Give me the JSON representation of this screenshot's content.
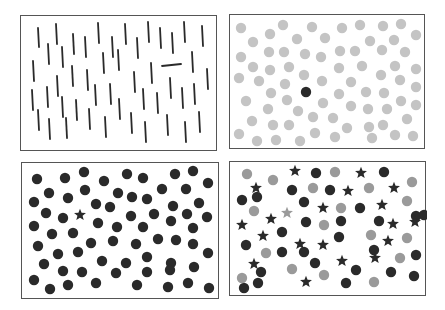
{
  "figure": {
    "title": "Visual search display examples",
    "colors": {
      "background": "#ffffff",
      "border": "#555555",
      "dark": "#2a2a2a",
      "light_gray": "#c4c4c4",
      "mid_gray": "#9a9a9a"
    },
    "panels": [
      {
        "id": "orientation",
        "label": "Orientation pop-out",
        "rect": [
          20,
          15,
          197,
          136
        ],
        "distractor": "vertical-bar",
        "target": "horizontal-bar",
        "items": {
          "vertical_bars": [
            [
              37,
              27,
              46
            ],
            [
              55,
              23,
              43
            ],
            [
              72,
              33,
              53
            ],
            [
              84,
              36,
              56
            ],
            [
              97,
              22,
              42
            ],
            [
              124,
              23,
              43
            ],
            [
              147,
              21,
              41
            ],
            [
              159,
              27,
              47
            ],
            [
              183,
              21,
              41
            ],
            [
              201,
              25,
              45
            ],
            [
              47,
              43,
              63
            ],
            [
              61,
              46,
              66
            ],
            [
              111,
              36,
              56
            ],
            [
              136,
              37,
              57
            ],
            [
              171,
              32,
              52
            ],
            [
              102,
              52,
              72
            ],
            [
              117,
              49,
              69
            ],
            [
              191,
              51,
              71
            ],
            [
              32,
              60,
              80
            ],
            [
              71,
              65,
              85
            ],
            [
              56,
              75,
              95
            ],
            [
              86,
              69,
              89
            ],
            [
              150,
              62,
              82
            ],
            [
              206,
              68,
              88
            ],
            [
              133,
              71,
              91
            ],
            [
              31,
              89,
              109
            ],
            [
              46,
              86,
              106
            ],
            [
              61,
              96,
              116
            ],
            [
              94,
              84,
              104
            ],
            [
              109,
              83,
              103
            ],
            [
              169,
              77,
              97
            ],
            [
              181,
              87,
              107
            ],
            [
              193,
              83,
              103
            ],
            [
              75,
              99,
              119
            ],
            [
              118,
              98,
              118
            ],
            [
              142,
              88,
              108
            ],
            [
              156,
              92,
              112
            ],
            [
              37,
              109,
              129
            ],
            [
              48,
              118,
              138
            ],
            [
              65,
              117,
              137
            ],
            [
              88,
              108,
              128
            ],
            [
              104,
              116,
              136
            ],
            [
              130,
              112,
              132
            ],
            [
              144,
              121,
              141
            ],
            [
              166,
              114,
              134
            ],
            [
              184,
              121,
              141
            ],
            [
              198,
              111,
              131
            ]
          ],
          "horizontal_bars": [
            [
              161,
              180,
              64
            ]
          ]
        }
      },
      {
        "id": "color",
        "label": "Color pop-out",
        "rect": [
          229,
          14,
          196,
          135
        ],
        "distractor": "light-gray-circle",
        "target": "black-circle",
        "items": {
          "gray_circles": [
            [
              240,
              27
            ],
            [
              282,
              24
            ],
            [
              311,
              26
            ],
            [
              341,
              27
            ],
            [
              359,
              24
            ],
            [
              382,
              25
            ],
            [
              400,
              23
            ],
            [
              415,
              34
            ],
            [
              252,
              41
            ],
            [
              269,
              33
            ],
            [
              296,
              38
            ],
            [
              324,
              37
            ],
            [
              369,
              40
            ],
            [
              393,
              39
            ],
            [
              240,
              56
            ],
            [
              268,
              51
            ],
            [
              283,
              51
            ],
            [
              304,
              53
            ],
            [
              320,
              56
            ],
            [
              339,
              50
            ],
            [
              354,
              50
            ],
            [
              381,
              49
            ],
            [
              404,
              51
            ],
            [
              252,
              66
            ],
            [
              269,
              69
            ],
            [
              288,
              66
            ],
            [
              338,
              67
            ],
            [
              361,
              65
            ],
            [
              380,
              74
            ],
            [
              394,
              65
            ],
            [
              415,
              68
            ],
            [
              238,
              77
            ],
            [
              258,
              80
            ],
            [
              284,
              83
            ],
            [
              303,
              74
            ],
            [
              321,
              80
            ],
            [
              350,
              81
            ],
            [
              399,
              79
            ],
            [
              415,
              86
            ],
            [
              270,
              92
            ],
            [
              286,
              99
            ],
            [
              338,
              93
            ],
            [
              365,
              91
            ],
            [
              383,
              92
            ],
            [
              245,
              100
            ],
            [
              267,
              108
            ],
            [
              297,
              110
            ],
            [
              322,
              102
            ],
            [
              350,
              105
            ],
            [
              367,
              108
            ],
            [
              386,
              108
            ],
            [
              400,
              100
            ],
            [
              415,
              104
            ],
            [
              251,
              120
            ],
            [
              272,
              124
            ],
            [
              288,
              124
            ],
            [
              312,
              116
            ],
            [
              332,
              117
            ],
            [
              346,
              127
            ],
            [
              368,
              126
            ],
            [
              382,
              124
            ],
            [
              406,
              118
            ],
            [
              238,
              133
            ],
            [
              256,
              140
            ],
            [
              275,
              139
            ],
            [
              299,
              140
            ],
            [
              314,
              132
            ],
            [
              334,
              136
            ],
            [
              371,
              137
            ],
            [
              394,
              134
            ],
            [
              412,
              135
            ]
          ],
          "black_circles": [
            [
              305,
              91
            ]
          ]
        }
      },
      {
        "id": "shape",
        "label": "Shape pop-out",
        "rect": [
          21,
          162,
          198,
          137
        ],
        "distractor": "black-circle",
        "target": "black-star",
        "items": {
          "black_circles": [
            [
              36,
              178
            ],
            [
              64,
              177
            ],
            [
              83,
              171
            ],
            [
              103,
              180
            ],
            [
              126,
              173
            ],
            [
              142,
              177
            ],
            [
              174,
              173
            ],
            [
              192,
              170
            ],
            [
              207,
              182
            ],
            [
              48,
              192
            ],
            [
              67,
              197
            ],
            [
              84,
              189
            ],
            [
              117,
              192
            ],
            [
              131,
              196
            ],
            [
              161,
              188
            ],
            [
              185,
              188
            ],
            [
              33,
              201
            ],
            [
              95,
              203
            ],
            [
              109,
              206
            ],
            [
              146,
              198
            ],
            [
              198,
              202
            ],
            [
              45,
              212
            ],
            [
              62,
              217
            ],
            [
              130,
              215
            ],
            [
              153,
              213
            ],
            [
              172,
              205
            ],
            [
              186,
              213
            ],
            [
              206,
              216
            ],
            [
              33,
              225
            ],
            [
              51,
              233
            ],
            [
              72,
              232
            ],
            [
              97,
              222
            ],
            [
              116,
              226
            ],
            [
              142,
              226
            ],
            [
              170,
              220
            ],
            [
              192,
              227
            ],
            [
              37,
              245
            ],
            [
              90,
              242
            ],
            [
              112,
              240
            ],
            [
              135,
              243
            ],
            [
              157,
              238
            ],
            [
              175,
              239
            ],
            [
              192,
              243
            ],
            [
              207,
              252
            ],
            [
              57,
              253
            ],
            [
              77,
              251
            ],
            [
              101,
              260
            ],
            [
              125,
              262
            ],
            [
              146,
              256
            ],
            [
              170,
              262
            ],
            [
              193,
              266
            ],
            [
              43,
              263
            ],
            [
              62,
              270
            ],
            [
              81,
              271
            ],
            [
              115,
              272
            ],
            [
              146,
              271
            ],
            [
              169,
              269
            ],
            [
              33,
              279
            ],
            [
              49,
              288
            ],
            [
              67,
              284
            ],
            [
              95,
              282
            ],
            [
              136,
              284
            ],
            [
              167,
              286
            ],
            [
              187,
              282
            ],
            [
              208,
              287
            ]
          ],
          "black_stars": [
            [
              79,
              214
            ]
          ]
        }
      },
      {
        "id": "conjunction",
        "label": "Conjunction search",
        "rect": [
          229,
          161,
          197,
          135
        ],
        "distractors": [
          "black-circle",
          "mid-gray-circle",
          "black-star"
        ],
        "target": "mid-gray-star",
        "items": {
          "black_circles": [
            [
              315,
              172
            ],
            [
              383,
              171
            ],
            [
              241,
              199
            ],
            [
              291,
              189
            ],
            [
              329,
              189
            ],
            [
              256,
              196
            ],
            [
              303,
              201
            ],
            [
              359,
              207
            ],
            [
              305,
              221
            ],
            [
              378,
              220
            ],
            [
              415,
              215
            ],
            [
              281,
              231
            ],
            [
              340,
              220
            ],
            [
              423,
              214
            ],
            [
              245,
              244
            ],
            [
              281,
              251
            ],
            [
              338,
              236
            ],
            [
              303,
              251
            ],
            [
              373,
              249
            ],
            [
              415,
              254
            ],
            [
              314,
              262
            ],
            [
              260,
              271
            ],
            [
              355,
              269
            ],
            [
              390,
              271
            ],
            [
              257,
              282
            ],
            [
              345,
              282
            ],
            [
              413,
              275
            ],
            [
              243,
              287
            ]
          ],
          "gray_circles": [
            [
              246,
              173
            ],
            [
              272,
              179
            ],
            [
              334,
              171
            ],
            [
              312,
              187
            ],
            [
              368,
              187
            ],
            [
              411,
              181
            ],
            [
              253,
              210
            ],
            [
              340,
              207
            ],
            [
              406,
              200
            ],
            [
              323,
              224
            ],
            [
              370,
              234
            ],
            [
              406,
              237
            ],
            [
              265,
              252
            ],
            [
              399,
              257
            ],
            [
              291,
              268
            ],
            [
              323,
              274
            ],
            [
              241,
              277
            ],
            [
              373,
              281
            ]
          ],
          "black_stars": [
            [
              294,
              170
            ],
            [
              360,
              172
            ],
            [
              255,
              187
            ],
            [
              347,
              190
            ],
            [
              393,
              187
            ],
            [
              322,
              207
            ],
            [
              381,
              204
            ],
            [
              270,
              218
            ],
            [
              241,
              224
            ],
            [
              392,
              223
            ],
            [
              414,
              221
            ],
            [
              262,
              235
            ],
            [
              299,
              243
            ],
            [
              322,
              244
            ],
            [
              387,
              240
            ],
            [
              253,
              263
            ],
            [
              341,
              260
            ],
            [
              374,
              257
            ],
            [
              305,
              281
            ]
          ],
          "gray_stars": [
            [
              286,
              212
            ]
          ]
        }
      }
    ]
  }
}
